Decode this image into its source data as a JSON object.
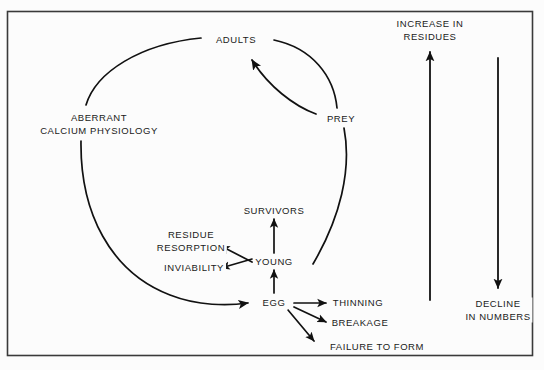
{
  "figure": {
    "kind": "flow-diagram",
    "background_color": "#fcfcfc",
    "border_color": "#3a3a3a",
    "line_color": "#111111",
    "text_color": "#1a1a1a"
  },
  "nodes": {
    "aberrant_calcium_physiology": "ABERRANT\nCALCIUM PHYSIOLOGY",
    "adults": "ADULTS",
    "prey": "PREY",
    "survivors": "SURVIVORS",
    "young": "YOUNG",
    "egg": "EGG",
    "residue_resorption": "RESIDUE\nRESORPTION",
    "inviability": "INVIABILITY",
    "thinning": "THINNING",
    "breakage": "BREAKAGE",
    "failure_to_form": "FAILURE TO FORM",
    "increase_in_residues": "INCREASE IN\nRESIDUES",
    "decline_in_numbers": "DECLINE\nIN NUMBERS"
  },
  "edges": [
    {
      "id": "adults-to-prey",
      "from": "ADULTS",
      "to": "PREY",
      "style": "curve",
      "arrowhead": false
    },
    {
      "id": "prey-to-adults",
      "from": "PREY",
      "to": "ADULTS",
      "style": "curve",
      "arrowhead": true
    },
    {
      "id": "prey-to-cycle",
      "from": "PREY",
      "to": "",
      "style": "curve",
      "arrowhead": false
    },
    {
      "id": "aberrant-to-adults",
      "from": "ABERRANT CALCIUM PHYSIOLOGY",
      "to": "ADULTS",
      "style": "curve",
      "arrowhead": false
    },
    {
      "id": "aberrant-to-egg",
      "from": "ABERRANT CALCIUM PHYSIOLOGY",
      "to": "EGG",
      "style": "curve",
      "arrowhead": true
    },
    {
      "id": "egg-to-young",
      "from": "EGG",
      "to": "YOUNG",
      "style": "straight",
      "arrowhead": true
    },
    {
      "id": "young-to-survivors",
      "from": "YOUNG",
      "to": "SURVIVORS",
      "style": "straight",
      "arrowhead": true
    },
    {
      "id": "young-to-residue-resorption",
      "from": "YOUNG",
      "to": "RESIDUE RESORPTION",
      "style": "straight",
      "arrowhead": true
    },
    {
      "id": "young-to-inviability",
      "from": "YOUNG",
      "to": "INVIABILITY",
      "style": "straight",
      "arrowhead": true
    },
    {
      "id": "egg-to-thinning",
      "from": "EGG",
      "to": "THINNING",
      "style": "straight",
      "arrowhead": true
    },
    {
      "id": "egg-to-breakage",
      "from": "EGG",
      "to": "BREAKAGE",
      "style": "straight",
      "arrowhead": true
    },
    {
      "id": "egg-to-failure-to-form",
      "from": "EGG",
      "to": "FAILURE TO FORM",
      "style": "straight",
      "arrowhead": true
    },
    {
      "id": "increase-in-residues-axis",
      "from": "",
      "to": "INCREASE IN RESIDUES",
      "style": "straight",
      "arrowhead": true,
      "direction": "up"
    },
    {
      "id": "decline-in-numbers-axis",
      "from": "",
      "to": "DECLINE IN NUMBERS",
      "style": "straight",
      "arrowhead": true,
      "direction": "down"
    }
  ]
}
